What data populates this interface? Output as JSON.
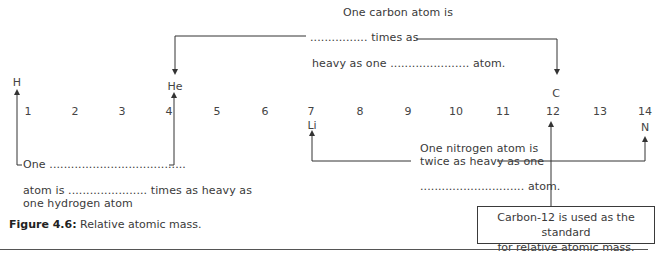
{
  "diagram": {
    "number_line": [
      "1",
      "2",
      "3",
      "4",
      "5",
      "6",
      "7",
      "8",
      "9",
      "10",
      "11",
      "12",
      "13",
      "14"
    ],
    "elements": {
      "H": "H",
      "He": "He",
      "Li": "Li",
      "C": "C",
      "N": "N"
    },
    "carbon_statement": {
      "line1": "One carbon atom is",
      "line2": "................ times as",
      "line3": "heavy as one ...................... atom."
    },
    "hydrogen_statement": {
      "line1": "One ......................................",
      "line2": "atom is ...................... times as heavy as",
      "line3": "one hydrogen atom"
    },
    "nitrogen_statement": {
      "line1": "One nitrogen atom is",
      "line2": "twice as heavy as one",
      "line3": "............................. atom."
    },
    "standard_box": {
      "line1": "Carbon-12 is used as the standard",
      "line2": "for relative atomic mass."
    }
  },
  "caption": {
    "label": "Figure 4.6:",
    "text": " Relative atomic mass."
  }
}
